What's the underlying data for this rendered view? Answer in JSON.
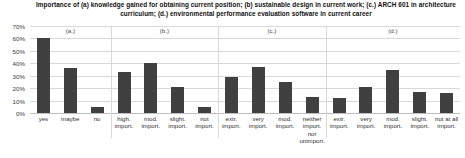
{
  "chart_data": {
    "type": "bar",
    "title": "Importance of (a) knowledge gained for obtaining current position; (b) sustainable design in current work; (c.) ARCH 601 in architecture curriculum; (d.) environmental performance evaluation software in current career",
    "xlabel": "",
    "ylabel": "",
    "ylim": [
      0,
      70
    ],
    "grid": true,
    "legend": "none",
    "bar_color": "#404040",
    "grid_color": "#d9d9d9",
    "ytick_labels": [
      "70%",
      "60%",
      "50%",
      "40%",
      "30%",
      "20%",
      "10%",
      "0%"
    ],
    "ytick_values": [
      70,
      60,
      50,
      40,
      30,
      20,
      10,
      0
    ],
    "group_annotations": [
      "(a.)",
      "(b.)",
      "(c.)",
      "(d.)"
    ],
    "groups": [
      {
        "name": "(a.)",
        "categories": [
          "yes",
          "maybe",
          "no"
        ],
        "values": [
          60,
          36,
          5
        ]
      },
      {
        "name": "(b.)",
        "categories": [
          "high. import.",
          "mod. import.",
          "slight. import.",
          "not import."
        ],
        "values": [
          33,
          40,
          21,
          5
        ]
      },
      {
        "name": "(c.)",
        "categories": [
          "extr. import.",
          "very import.",
          "mod. import.",
          "neither import. nor unimport."
        ],
        "values": [
          29,
          37,
          25,
          13
        ]
      },
      {
        "name": "(d.)",
        "categories": [
          "extr. import.",
          "very import.",
          "mod. import.",
          "slight. import.",
          "not at all import."
        ],
        "values": [
          12,
          21,
          35,
          17,
          16
        ]
      }
    ],
    "categories": [
      "yes",
      "maybe",
      "no",
      "high. import.",
      "mod. import.",
      "slight. import.",
      "not import.",
      "extr. import.",
      "very import.",
      "mod. import.",
      "neither import. nor unimport.",
      "extr. import.",
      "very import.",
      "mod. import.",
      "slight. import.",
      "not at all import."
    ],
    "values": [
      60,
      36,
      5,
      33,
      40,
      21,
      5,
      29,
      37,
      25,
      13,
      12,
      21,
      35,
      17,
      16
    ]
  }
}
